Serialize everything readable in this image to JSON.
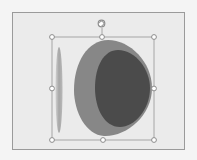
{
  "canvas": {
    "background": "#f4f4f4"
  },
  "slide": {
    "background": "#ebebeb",
    "border": "#9a9a9a"
  },
  "shapes": {
    "thin_ellipse": {
      "fill": "#a8a8a8",
      "highlight": "#cfcfcf"
    },
    "outer_egg": {
      "fill": "#878787"
    },
    "inner_egg": {
      "fill": "#4b4b4b"
    }
  },
  "selection": {
    "frame_color": "#a6a6a6",
    "handle_fill": "#ffffff",
    "handle_stroke": "#8c8c8c",
    "handles": [
      "top-left",
      "top-middle",
      "top-right",
      "middle-left",
      "middle-right",
      "bottom-left",
      "bottom-middle",
      "bottom-right"
    ],
    "rotate_handle": "rotate-icon"
  }
}
